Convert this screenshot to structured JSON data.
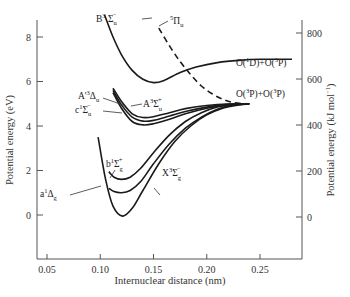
{
  "chart_data": {
    "type": "line",
    "title": "",
    "xlabel": "Internuclear distance (nm)",
    "ylabel": "Potential energy (eV)",
    "ylabel_right": "Potential energy (kJ mol⁻¹)",
    "xlim": [
      0.04,
      0.28
    ],
    "ylim": [
      -1.7,
      9.0
    ],
    "ylim_right": [
      -164,
      868
    ],
    "grid": false,
    "legend": "none (curves labeled directly)",
    "x_ticks": [
      0.05,
      0.1,
      0.15,
      0.2,
      0.25
    ],
    "x_tick_labels": [
      "0.05",
      "0.10",
      "0.15",
      "0.20",
      "0.25"
    ],
    "y_ticks": [
      0,
      2,
      4,
      6,
      8
    ],
    "y_tick_labels": [
      "0",
      "2",
      "4",
      "6",
      "8"
    ],
    "y_right_ticks": [
      0,
      200,
      400,
      600,
      800
    ],
    "y_right_tick_labels": [
      "0",
      "200",
      "400",
      "600",
      "800"
    ],
    "series": [
      {
        "name": "X3Σg−",
        "label": "X³Σg⁻",
        "style": "solid",
        "x": [
          0.098,
          0.105,
          0.112,
          0.121,
          0.13,
          0.14,
          0.155,
          0.17,
          0.185,
          0.2,
          0.215,
          0.23,
          0.24
        ],
        "y": [
          3.5,
          1.6,
          0.4,
          -0.05,
          0.3,
          1.1,
          2.3,
          3.3,
          4.0,
          4.5,
          4.8,
          4.95,
          5.0
        ]
      },
      {
        "name": "a1Δg",
        "label": "a¹Δg",
        "style": "solid",
        "x": [
          0.108,
          0.113,
          0.12,
          0.128,
          0.138,
          0.15,
          0.165,
          0.18,
          0.195,
          0.21,
          0.225,
          0.24
        ],
        "y": [
          1.2,
          1.05,
          1.0,
          1.1,
          1.5,
          2.3,
          3.2,
          3.9,
          4.4,
          4.75,
          4.95,
          5.0
        ]
      },
      {
        "name": "b1Σg+",
        "label": "b¹Σg⁺",
        "style": "solid",
        "x": [
          0.108,
          0.113,
          0.12,
          0.128,
          0.138,
          0.15,
          0.165,
          0.18,
          0.195,
          0.21,
          0.225,
          0.24
        ],
        "y": [
          1.95,
          1.7,
          1.6,
          1.7,
          2.1,
          2.8,
          3.6,
          4.2,
          4.6,
          4.85,
          4.98,
          5.0
        ]
      },
      {
        "name": "c1Σu−",
        "label": "c¹Σu⁻",
        "style": "solid",
        "x": [
          0.112,
          0.12,
          0.13,
          0.14,
          0.15,
          0.165,
          0.18,
          0.2,
          0.22,
          0.24
        ],
        "y": [
          5.5,
          4.8,
          4.2,
          4.05,
          4.1,
          4.3,
          4.55,
          4.8,
          4.95,
          5.0
        ]
      },
      {
        "name": "A'3Δu",
        "label": "A'³Δu",
        "style": "solid",
        "x": [
          0.112,
          0.12,
          0.13,
          0.14,
          0.15,
          0.165,
          0.18,
          0.2,
          0.22,
          0.24
        ],
        "y": [
          5.6,
          4.95,
          4.4,
          4.22,
          4.25,
          4.45,
          4.65,
          4.85,
          4.97,
          5.0
        ]
      },
      {
        "name": "A3Σu+",
        "label": "A³Σu⁺",
        "style": "solid",
        "x": [
          0.112,
          0.12,
          0.13,
          0.14,
          0.15,
          0.165,
          0.18,
          0.2,
          0.22,
          0.24
        ],
        "y": [
          5.7,
          5.1,
          4.55,
          4.38,
          4.42,
          4.6,
          4.78,
          4.92,
          4.99,
          5.0
        ]
      },
      {
        "name": "B3Σu−",
        "label": "B³Σu⁻",
        "style": "solid",
        "x": [
          0.104,
          0.112,
          0.12,
          0.13,
          0.14,
          0.15,
          0.16,
          0.175,
          0.19,
          0.21,
          0.23,
          0.25,
          0.28
        ],
        "y": [
          9.0,
          8.0,
          7.2,
          6.5,
          6.1,
          5.95,
          6.05,
          6.4,
          6.65,
          6.85,
          6.95,
          7.0,
          7.0
        ]
      },
      {
        "name": "5Πu",
        "label": "⁵Πu",
        "style": "dashed",
        "x": [
          0.155,
          0.165,
          0.175,
          0.185,
          0.195,
          0.205,
          0.215,
          0.225,
          0.235
        ],
        "y": [
          8.4,
          7.6,
          6.9,
          6.3,
          5.8,
          5.45,
          5.2,
          5.05,
          5.0
        ]
      }
    ],
    "annotations": [
      {
        "text": "O(¹D)+O(³P)",
        "x": 0.24,
        "y": 7.3
      },
      {
        "text": "O(³P)+O(³P)",
        "x": 0.24,
        "y": 5.3
      }
    ]
  },
  "axes": {
    "x_title": "Internuclear distance (nm)",
    "y_left_title": "Potential energy (eV)",
    "y_right_title": "Potential energy (kJ mol",
    "y_right_title_sup": "−1",
    "y_right_title_end": ")"
  },
  "labels": {
    "B": {
      "main": "B",
      "sup": "3",
      "sym": " Σ",
      "sub": "u",
      "sup2": "−"
    },
    "Pi5": {
      "sup": "5",
      "sym": "Π",
      "sub": "u"
    },
    "Ap": {
      "main": "A'",
      "sup": "3",
      "sym": "Δ",
      "sub": "u"
    },
    "A": {
      "main": "A",
      "sup": "3",
      "sym": "Σ",
      "sub": "u",
      "sup2": "+"
    },
    "c": {
      "main": "c",
      "sup": "1",
      "sym": "Σ",
      "sub": "u",
      "sup2": "−"
    },
    "b": {
      "main": "b",
      "sup": "1",
      "sym": "Σ",
      "sub": "g",
      "sup2": "+"
    },
    "X": {
      "main": "X",
      "sup": "3",
      "sym": "Σ",
      "sub": "g",
      "sup2": "−"
    },
    "a": {
      "main": "a",
      "sup": "1",
      "sym": "Δ",
      "sub": "g"
    },
    "O1D": {
      "a": "O(",
      "s1": "1",
      "b": "D)+O(",
      "s2": "3",
      "c": "P)"
    },
    "O3P": {
      "a": "O(",
      "s1": "3",
      "b": "P)+O(",
      "s2": "3",
      "c": "P)"
    }
  }
}
